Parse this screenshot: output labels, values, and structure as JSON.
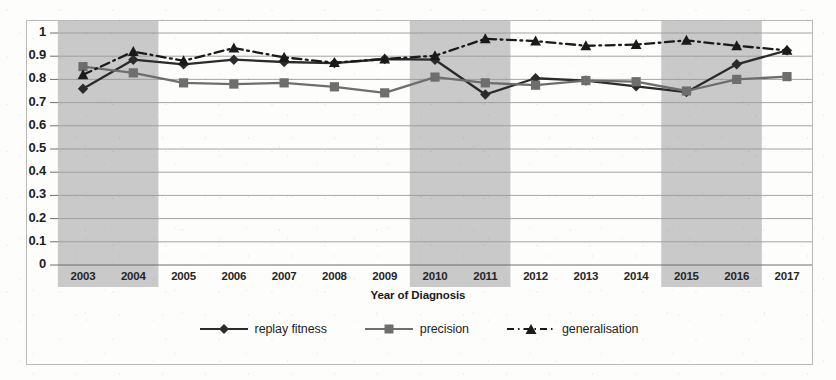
{
  "chart_data": {
    "type": "line",
    "title": "",
    "xlabel": "Year of Diagnosis",
    "ylabel": "",
    "categories": [
      "2003",
      "2004",
      "2005",
      "2006",
      "2007",
      "2008",
      "2009",
      "2010",
      "2011",
      "2012",
      "2013",
      "2014",
      "2015",
      "2016",
      "2017"
    ],
    "ylim": [
      0,
      1
    ],
    "ytick_values": [
      "0",
      "0.1",
      "0.2",
      "0.3",
      "0.4",
      "0.5",
      "0.6",
      "0.7",
      "0.8",
      "0.9",
      "1"
    ],
    "grid": true,
    "legend_position": "bottom",
    "series": [
      {
        "name": "replay fitness",
        "marker": "diamond",
        "linestyle": "solid",
        "color": "#2b2b2b",
        "values": [
          0.76,
          0.885,
          0.865,
          0.885,
          0.875,
          0.87,
          0.888,
          0.885,
          0.735,
          0.805,
          0.795,
          0.77,
          0.745,
          0.865,
          0.925
        ]
      },
      {
        "name": "precision",
        "marker": "square",
        "linestyle": "solid",
        "color": "#6e6e6e",
        "values": [
          0.855,
          0.828,
          0.785,
          0.78,
          0.785,
          0.768,
          0.742,
          0.81,
          0.785,
          0.775,
          0.795,
          0.79,
          0.75,
          0.8,
          0.812
        ]
      },
      {
        "name": "generalisation",
        "marker": "triangle",
        "linestyle": "dash-dot",
        "color": "#1a1a1a",
        "values": [
          0.82,
          0.92,
          0.88,
          0.935,
          0.895,
          0.872,
          0.888,
          0.902,
          0.975,
          0.965,
          0.945,
          0.95,
          0.968,
          0.945,
          0.925
        ]
      }
    ],
    "shaded_bands": [
      {
        "from": "2003",
        "to": "2004",
        "color": "#c9c9c9"
      },
      {
        "from": "2010",
        "to": "2011",
        "color": "#c9c9c9"
      },
      {
        "from": "2015",
        "to": "2016",
        "color": "#c9c9c9"
      }
    ]
  },
  "legend": {
    "items": [
      {
        "label": "replay fitness"
      },
      {
        "label": "precision"
      },
      {
        "label": "generalisation"
      }
    ]
  }
}
